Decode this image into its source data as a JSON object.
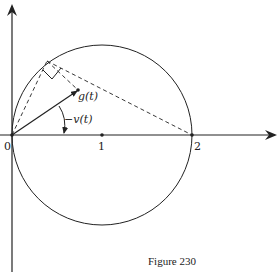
{
  "figure": {
    "caption": "Figure 230",
    "labels": {
      "origin": "0",
      "tick1": "1",
      "tick2": "2",
      "g": "g(t)",
      "angle": "−v(t)"
    },
    "colors": {
      "ink": "#222222",
      "background": "#ffffff"
    }
  }
}
